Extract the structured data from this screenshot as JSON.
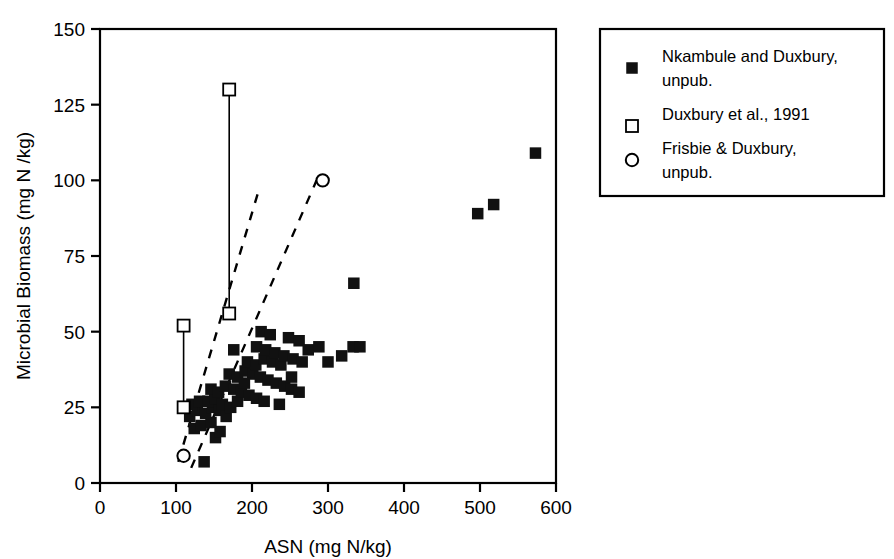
{
  "chart_data": {
    "type": "scatter",
    "title": "",
    "xlabel": "ASN (mg N/kg)",
    "ylabel": "Microbial Biomass (mg N /kg)",
    "xlim": [
      0,
      600
    ],
    "ylim": [
      0,
      150
    ],
    "xticks": [
      0,
      100,
      200,
      300,
      400,
      500,
      600
    ],
    "yticks": [
      0,
      25,
      50,
      75,
      100,
      125,
      150
    ],
    "xtick_labels": [
      "0",
      "100",
      "200",
      "300",
      "400",
      "500",
      "600"
    ],
    "ytick_labels": [
      "0",
      "25",
      "50",
      "75",
      "100",
      "125",
      "150"
    ],
    "grid": false,
    "legend_position": "right",
    "series": [
      {
        "name": "Nkambule and Duxbury, unpub.",
        "marker": "filled-square",
        "points": [
          [
            137,
            7
          ],
          [
            152,
            15
          ],
          [
            124,
            18
          ],
          [
            133,
            19
          ],
          [
            146,
            20
          ],
          [
            158,
            17
          ],
          [
            118,
            22
          ],
          [
            128,
            24
          ],
          [
            139,
            23
          ],
          [
            148,
            25
          ],
          [
            157,
            24
          ],
          [
            166,
            22
          ],
          [
            112,
            25
          ],
          [
            121,
            26
          ],
          [
            131,
            27
          ],
          [
            142,
            27
          ],
          [
            151,
            28
          ],
          [
            161,
            26
          ],
          [
            172,
            25
          ],
          [
            181,
            27
          ],
          [
            146,
            31
          ],
          [
            156,
            30
          ],
          [
            165,
            32
          ],
          [
            176,
            31
          ],
          [
            186,
            30
          ],
          [
            196,
            29
          ],
          [
            206,
            28
          ],
          [
            216,
            27
          ],
          [
            170,
            36
          ],
          [
            181,
            35
          ],
          [
            191,
            37
          ],
          [
            201,
            36
          ],
          [
            211,
            35
          ],
          [
            221,
            34
          ],
          [
            232,
            33
          ],
          [
            243,
            32
          ],
          [
            252,
            31
          ],
          [
            262,
            30
          ],
          [
            194,
            40
          ],
          [
            205,
            39
          ],
          [
            216,
            41
          ],
          [
            227,
            40
          ],
          [
            238,
            39
          ],
          [
            206,
            45
          ],
          [
            218,
            44
          ],
          [
            230,
            43
          ],
          [
            242,
            42
          ],
          [
            254,
            41
          ],
          [
            266,
            40
          ],
          [
            212,
            50
          ],
          [
            224,
            49
          ],
          [
            248,
            48
          ],
          [
            262,
            47
          ],
          [
            176,
            44
          ],
          [
            190,
            33
          ],
          [
            236,
            26
          ],
          [
            252,
            35
          ],
          [
            274,
            44
          ],
          [
            288,
            45
          ],
          [
            300,
            40
          ],
          [
            318,
            42
          ],
          [
            333,
            45
          ],
          [
            342,
            45
          ],
          [
            334,
            66
          ],
          [
            497,
            89
          ],
          [
            518,
            92
          ],
          [
            573,
            109
          ]
        ]
      },
      {
        "name": "Duxbury et al., 1991",
        "marker": "open-square",
        "points": [
          [
            110,
            52
          ],
          [
            110,
            25
          ],
          [
            170,
            130
          ],
          [
            170,
            56
          ]
        ],
        "connectors": [
          [
            [
              110,
              52
            ],
            [
              110,
              25
            ]
          ],
          [
            [
              170,
              130
            ],
            [
              170,
              56
            ]
          ]
        ]
      },
      {
        "name": "Frisbie & Duxbury, unpub.",
        "marker": "open-circle",
        "points": [
          [
            293,
            100
          ],
          [
            110,
            9
          ]
        ]
      }
    ],
    "dashed_lines": [
      {
        "name": "upper-bound-line",
        "x1": 103,
        "y1": 7,
        "x2": 208,
        "y2": 96
      },
      {
        "name": "lower-bound-line",
        "x1": 120,
        "y1": 5,
        "x2": 285,
        "y2": 100
      }
    ]
  },
  "legend": {
    "items": [
      {
        "marker": "filled-square",
        "label_line1": "Nkambule and Duxbury,",
        "label_line2": "unpub."
      },
      {
        "marker": "open-square",
        "label_line1": "Duxbury et al., 1991",
        "label_line2": ""
      },
      {
        "marker": "open-circle",
        "label_line1": "Frisbie & Duxbury,",
        "label_line2": "unpub."
      }
    ]
  },
  "colors": {
    "ink": "#000000",
    "marker_fill": "#111111",
    "background": "#ffffff"
  }
}
